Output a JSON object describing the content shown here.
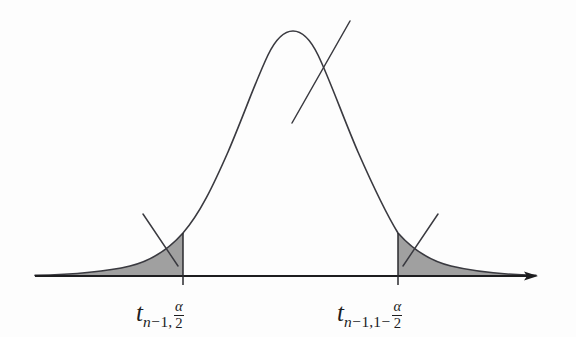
{
  "figure": {
    "name": "t-distribution-critical-values",
    "background_color": "#fdfdfd",
    "width": 576,
    "height": 337
  },
  "curve": {
    "name": "t-distribution-density-curve",
    "stroke_color": "#3a3a40",
    "stroke_width": 1.6,
    "peak_x": 293,
    "peak_y": 31,
    "baseline_y": 276
  },
  "axis": {
    "name": "horizontal-axis",
    "stroke_color": "#1d1d1f",
    "x_start": 35,
    "x_end": 538,
    "y": 276,
    "arrowhead": "right"
  },
  "regions": {
    "fill_color": "#a0a0a0",
    "left": {
      "label_id": "lower-critical-value",
      "boundary_x": 183,
      "boundary_top_y": 233,
      "boundary_bottom_y": 285
    },
    "right": {
      "label_id": "upper-critical-value",
      "boundary_x": 398,
      "boundary_top_y": 233,
      "boundary_bottom_y": 285
    }
  },
  "leaders": [
    {
      "name": "leader-line-left-tail",
      "x1": 143,
      "y1": 214,
      "x2": 178,
      "y2": 266
    },
    {
      "name": "leader-line-center-peak",
      "x1": 292,
      "y1": 123,
      "x2": 350,
      "y2": 21
    },
    {
      "name": "leader-line-right-tail",
      "x1": 438,
      "y1": 214,
      "x2": 403,
      "y2": 266
    }
  ],
  "labels": {
    "lower_critical_value": {
      "base": "t",
      "sub_prefix": "n",
      "sub_minus": "−",
      "sub_degrees": "1",
      "sub_comma": ",",
      "frac_num": "α",
      "frac_den": "2",
      "plain": "t_{n-1, α/2}"
    },
    "upper_critical_value": {
      "base": "t",
      "sub_prefix": "n",
      "sub_minus": "−",
      "sub_degrees": "1",
      "sub_comma": ",",
      "sub_one": "1",
      "sub_minus2": "−",
      "frac_num": "α",
      "frac_den": "2",
      "plain": "t_{n-1, 1-α/2}"
    }
  }
}
